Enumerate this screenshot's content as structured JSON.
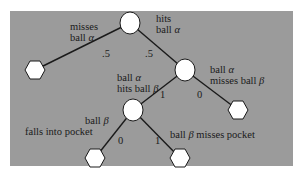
{
  "tree": {
    "root_left_label": [
      "misses",
      "ball",
      "α"
    ],
    "root_right_label": [
      "hits",
      "ball",
      "α"
    ],
    "root_left_prob": ".5",
    "root_right_prob": ".5",
    "node2_left_label": [
      "ball",
      "α",
      "hits ball",
      "β"
    ],
    "node2_right_label": [
      "ball",
      "α",
      "misses ball",
      "β"
    ],
    "node2_left_prob": "1",
    "node2_right_prob": "0",
    "node3_left_label": [
      "ball",
      "β",
      "falls into pocket"
    ],
    "node3_right_label": [
      "ball",
      "β",
      "misses pocket"
    ],
    "node3_left_prob": "0",
    "node3_right_prob": "1"
  },
  "colors": {
    "panel": "#9b9b9b",
    "node_fill": "#ffffff",
    "edge": "#1a1a1a"
  }
}
